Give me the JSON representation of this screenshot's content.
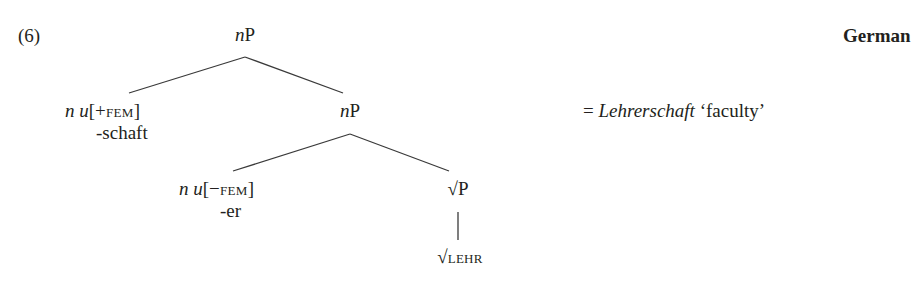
{
  "example": {
    "number": "(6)",
    "language": "German",
    "gloss": {
      "equals": "=",
      "word": "Lehrerschaft",
      "translation": "‘faculty’"
    }
  },
  "tree": {
    "root": {
      "n": "n",
      "label": "P"
    },
    "left_head": {
      "n": "n",
      "u": "u",
      "feature_open": "[",
      "feature": "+fem",
      "feature_close": "]",
      "exponent": "-schaft"
    },
    "inner_np": {
      "n": "n",
      "label": "P"
    },
    "inner_head": {
      "n": "n",
      "u": "u",
      "feature_open": "[",
      "feature": "−fem",
      "feature_close": "]",
      "exponent": "-er"
    },
    "root_phrase": {
      "sqrt": "√",
      "label": "P"
    },
    "root_terminal": {
      "sqrt": "√",
      "label": "lehr"
    }
  }
}
